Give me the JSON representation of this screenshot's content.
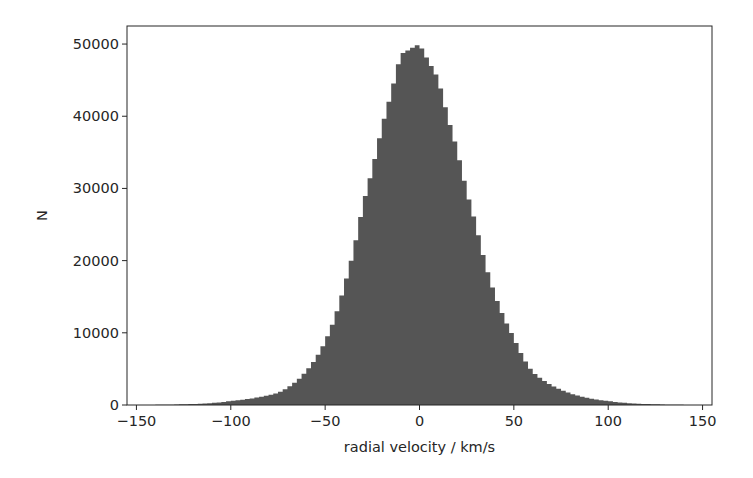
{
  "chart_data": {
    "type": "bar",
    "subtype": "histogram",
    "title": "",
    "xlabel": "radial velocity / km/s",
    "ylabel": "N",
    "xlim": [
      -155,
      155
    ],
    "ylim": [
      0,
      52500
    ],
    "xticks": [
      -150,
      -100,
      -50,
      0,
      50,
      100,
      150
    ],
    "xtick_labels": [
      "−150",
      "−100",
      "−50",
      "0",
      "50",
      "100",
      "150"
    ],
    "yticks": [
      0,
      10000,
      20000,
      30000,
      40000,
      50000
    ],
    "ytick_labels": [
      "0",
      "10000",
      "20000",
      "30000",
      "40000",
      "50000"
    ],
    "grid": false,
    "legend": null,
    "bar_color": "#555555",
    "bin_width": 2.5,
    "bin_range": [
      -150,
      150
    ],
    "anchor_points": {
      "x": [
        -150,
        -140,
        -125,
        -100,
        -75,
        -60,
        -50,
        -40,
        -30,
        -20,
        -10,
        0,
        10,
        20,
        30,
        40,
        50,
        60,
        75,
        100,
        125,
        140,
        150
      ],
      "y": [
        5,
        20,
        100,
        550,
        1700,
        4700,
        8800,
        16400,
        27800,
        38500,
        48600,
        50000,
        45200,
        35400,
        25000,
        15300,
        9400,
        4600,
        2100,
        550,
        100,
        20,
        5
      ]
    }
  },
  "figure": {
    "axes_box": {
      "left": 127,
      "top": 26,
      "right": 712,
      "bottom": 405
    },
    "frame_color": "#262626",
    "background": "#ffffff"
  }
}
